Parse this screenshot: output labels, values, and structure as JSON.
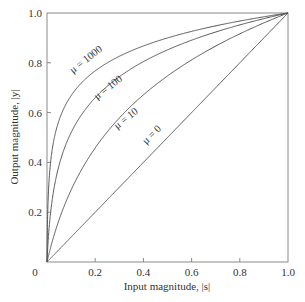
{
  "chart_data": {
    "type": "line",
    "title": "",
    "xlabel": "Input magnitude, |s|",
    "ylabel": "Output magnitude, |y|",
    "xlim": [
      0,
      1.0
    ],
    "ylim": [
      0,
      1.0
    ],
    "grid": false,
    "legend": "inline curve labels",
    "x_ticks": [
      "0",
      "0.2",
      "0.4",
      "0.6",
      "0.8",
      "1.0"
    ],
    "y_ticks": [
      "0.2",
      "0.4",
      "0.6",
      "0.8",
      "1.0"
    ],
    "formula": "y = ln(1 + mu*x) / ln(1 + mu)",
    "series": [
      {
        "name": "μ = 1000",
        "mu": 1000,
        "x": [
          0,
          0.05,
          0.1,
          0.2,
          0.4,
          0.6,
          0.8,
          1.0
        ],
        "values": [
          0,
          0.57,
          0.67,
          0.77,
          0.87,
          0.93,
          0.97,
          1.0
        ]
      },
      {
        "name": "μ = 100",
        "mu": 100,
        "x": [
          0,
          0.05,
          0.1,
          0.2,
          0.4,
          0.6,
          0.8,
          1.0
        ],
        "values": [
          0,
          0.39,
          0.52,
          0.66,
          0.81,
          0.89,
          0.95,
          1.0
        ]
      },
      {
        "name": "μ = 10",
        "mu": 10,
        "x": [
          0,
          0.05,
          0.1,
          0.2,
          0.4,
          0.6,
          0.8,
          1.0
        ],
        "values": [
          0,
          0.17,
          0.29,
          0.46,
          0.65,
          0.81,
          0.91,
          1.0
        ]
      },
      {
        "name": "μ = 0",
        "mu": 0,
        "x": [
          0,
          0.2,
          0.4,
          0.6,
          0.8,
          1.0
        ],
        "values": [
          0,
          0.2,
          0.4,
          0.6,
          0.8,
          1.0
        ]
      }
    ],
    "label_positions": [
      {
        "text": "μ = 1000",
        "x": 88,
        "y": 62,
        "angle": -38
      },
      {
        "text": "μ = 100",
        "x": 110,
        "y": 90,
        "angle": -38
      },
      {
        "text": "μ = 10",
        "x": 128,
        "y": 121,
        "angle": -38
      },
      {
        "text": "μ = 0",
        "x": 154,
        "y": 137,
        "angle": -45
      }
    ]
  },
  "colors": {
    "line": "#555555",
    "axis": "#888888",
    "text": "#333333"
  }
}
